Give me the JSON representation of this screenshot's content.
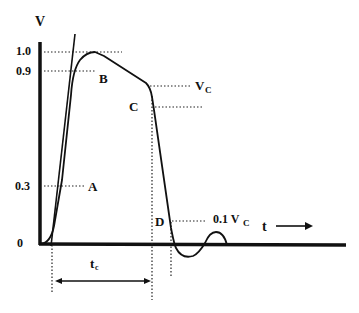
{
  "diagram": {
    "type": "pulse-waveform",
    "axes": {
      "y_label": "V",
      "x_label": "t",
      "x_arrow": "→",
      "y_ticks": [
        "1.0",
        "0.9",
        "0.3",
        "0"
      ]
    },
    "points": {
      "A": "A",
      "B": "B",
      "C": "C",
      "D": "D"
    },
    "annotations": {
      "vc_main": "V",
      "vc_sub": "C",
      "tenth_prefix": "0.1 V",
      "tenth_sub": "C",
      "tc_main": "t",
      "tc_sub": "c"
    },
    "colors": {
      "line": "#111111",
      "background": "#ffffff"
    }
  }
}
